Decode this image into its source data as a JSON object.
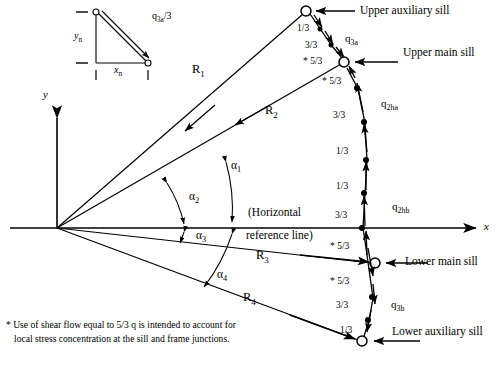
{
  "figure": {
    "axes": {
      "x_label": "x",
      "y_label": "y",
      "horizontal_reference_line_1": "(Horizontal",
      "horizontal_reference_line_2": "reference line)"
    },
    "inset": {
      "y_label": "y",
      "y_sub": "n",
      "x_label": "x",
      "x_sub": "n",
      "flow_label": "q",
      "flow_sub": "3a",
      "flow_suffix": "/3"
    },
    "rays": [
      {
        "name": "R",
        "sub": "1"
      },
      {
        "name": "R",
        "sub": "2"
      },
      {
        "name": "R",
        "sub": "3"
      },
      {
        "name": "R",
        "sub": "4"
      }
    ],
    "angles": [
      {
        "name": "α",
        "sub": "1"
      },
      {
        "name": "α",
        "sub": "2"
      },
      {
        "name": "α",
        "sub": "3"
      },
      {
        "name": "α",
        "sub": "4"
      }
    ],
    "sills": [
      {
        "id": "upper-auxiliary-sill",
        "label": "Upper auxiliary sill"
      },
      {
        "id": "upper-main-sill",
        "label": "Upper main sill"
      },
      {
        "id": "lower-main-sill",
        "label": "Lower main sill"
      },
      {
        "id": "lower-auxiliary-sill",
        "label": "Lower auxiliary sill"
      }
    ],
    "shear_flows": [
      {
        "name": "q",
        "sub": "3a"
      },
      {
        "name": "q",
        "sub": "2ha"
      },
      {
        "name": "q",
        "sub": "2hb"
      },
      {
        "name": "q",
        "sub": "3b"
      }
    ],
    "fractions": {
      "upper_segment": [
        "1/3",
        "3/3",
        "* 5/3"
      ],
      "upper_to_mid": [
        "* 5/3",
        "3/3",
        "1/3",
        "1/3",
        "3/3"
      ],
      "mid_to_lower": [
        "* 5/3",
        "* 5/3",
        "3/3",
        "1/3"
      ]
    },
    "footnote": {
      "line1": "* Use of shear flow equal to 5/3 q is intended to account for",
      "line2": "local stress concentration at the sill and frame junctions."
    },
    "colors": {
      "ink": "#000000",
      "paper": "#ffffff"
    }
  }
}
